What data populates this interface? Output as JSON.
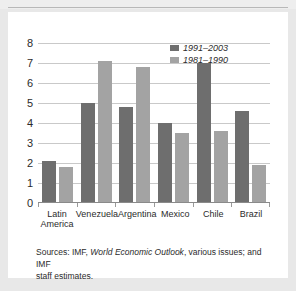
{
  "figure": {
    "clipped_title_fragment": "Figure 1. Real GDP Growth",
    "panel_background": "#ffffff",
    "page_background": "#e8e8e8"
  },
  "legend": {
    "position": "top-right",
    "entries": [
      {
        "label": "1991–2003",
        "color": "#6e6e6e"
      },
      {
        "label": "1981–1990",
        "color": "#a3a3a3"
      }
    ]
  },
  "source": {
    "line1_prefix": "Sources: IMF, ",
    "line1_italic": "World Economic Outlook",
    "line1_suffix": ", various issues; and IMF",
    "line2": "staff estimates."
  },
  "chart_data": {
    "type": "bar",
    "title": "",
    "xlabel": "",
    "ylabel": "",
    "ylim": [
      0,
      8
    ],
    "ytick_step": 1,
    "yticks": [
      "8",
      "7",
      "6",
      "5",
      "4",
      "3",
      "2",
      "1",
      "0"
    ],
    "grid": true,
    "legend_position": "top-right",
    "categories": [
      "Latin America",
      "Venezuela",
      "Argentina",
      "Mexico",
      "Chile",
      "Brazil"
    ],
    "category_lines": [
      [
        "Latin",
        "America"
      ],
      [
        "Venezuela"
      ],
      [
        "Argentina"
      ],
      [
        "Mexico"
      ],
      [
        "Chile"
      ],
      [
        "Brazil"
      ]
    ],
    "series": [
      {
        "name": "1991–2003",
        "color": "#6e6e6e",
        "values": [
          2.1,
          5.0,
          4.8,
          4.0,
          7.0,
          4.6
        ]
      },
      {
        "name": "1981–1990",
        "color": "#a3a3a3",
        "values": [
          1.8,
          7.1,
          6.8,
          3.5,
          3.6,
          1.9
        ]
      }
    ]
  }
}
